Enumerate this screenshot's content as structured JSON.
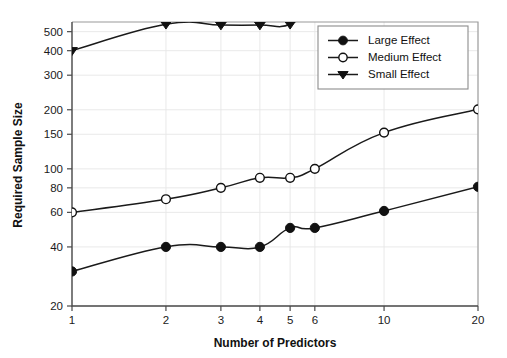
{
  "chart_data": {
    "type": "line",
    "title": "",
    "xlabel": "Number of Predictors",
    "ylabel": "Required Sample Size",
    "xscale": "log",
    "yscale": "log",
    "grid": true,
    "legend_position": "top-right",
    "x": [
      1,
      2,
      3,
      4,
      5,
      6,
      10,
      20
    ],
    "xtick_labels": [
      "1",
      "2",
      "3",
      "4",
      "5",
      "6",
      "10",
      "20"
    ],
    "xlim": [
      1,
      20
    ],
    "ylim": [
      20,
      560
    ],
    "ytick_values": [
      20,
      40,
      60,
      80,
      100,
      150,
      200,
      300,
      400,
      500
    ],
    "ytick_labels": [
      "20",
      "40",
      "60",
      "80",
      "100",
      "150",
      "200",
      "300",
      "400",
      "500"
    ],
    "series": [
      {
        "name": "Large Effect",
        "marker": "filled-circle",
        "values": [
          30,
          40,
          40,
          40,
          50,
          50,
          61,
          81
        ]
      },
      {
        "name": "Medium Effect",
        "marker": "open-circle",
        "values": [
          60,
          70,
          80,
          90,
          90,
          100,
          153,
          201
        ]
      },
      {
        "name": "Small Effect",
        "marker": "filled-triangle-down",
        "values": [
          400,
          545,
          540,
          540,
          545,
          700,
          null,
          null
        ],
        "note": "clipped above plot area beyond x=5"
      }
    ]
  },
  "legend": {
    "entries": [
      {
        "label": "Large Effect",
        "marker": "filled-circle"
      },
      {
        "label": "Medium Effect",
        "marker": "open-circle"
      },
      {
        "label": "Small Effect",
        "marker": "filled-triangle-down"
      }
    ]
  },
  "colors": {
    "line": "#1a1a1a",
    "grid": "#e6e6e6",
    "axis": "#4a4a4a",
    "frame": "#9a9a9a",
    "background": "#ffffff"
  }
}
